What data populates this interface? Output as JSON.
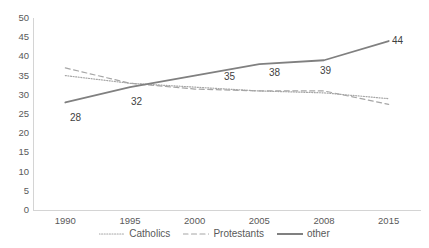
{
  "chart_data": {
    "type": "line",
    "title": "",
    "xlabel": "",
    "ylabel": "",
    "categories": [
      "1990",
      "1995",
      "2000",
      "2005",
      "2008",
      "2015"
    ],
    "ylim": [
      0,
      50
    ],
    "yticks": [
      "0",
      "5",
      "10",
      "15",
      "20",
      "25",
      "30",
      "35",
      "40",
      "45",
      "50"
    ],
    "grid": false,
    "legend_position": "bottom",
    "series": [
      {
        "name": "Catholics",
        "style": "dotted",
        "color": "#a6a6a6",
        "values": [
          35,
          33,
          32,
          31,
          30.5,
          29
        ],
        "labels": []
      },
      {
        "name": "Protestants",
        "style": "dashed",
        "color": "#a6a6a6",
        "values": [
          37,
          33,
          31.5,
          31,
          31,
          27.5
        ],
        "labels": []
      },
      {
        "name": "other",
        "style": "solid",
        "color": "#808080",
        "values": [
          28,
          32,
          35,
          38,
          39,
          44
        ],
        "labels": [
          "28",
          "32",
          "35",
          "38",
          "39",
          "44"
        ]
      }
    ],
    "data_labels": [
      {
        "text": "28",
        "x": 70,
        "y": 113
      },
      {
        "text": "32",
        "x": 131,
        "y": 97
      },
      {
        "text": "35",
        "x": 224,
        "y": 72
      },
      {
        "text": "38",
        "x": 269,
        "y": 68
      },
      {
        "text": "39",
        "x": 320,
        "y": 66
      },
      {
        "text": "44",
        "x": 392,
        "y": 36
      }
    ]
  },
  "legend": {
    "items": [
      {
        "label": "Catholics",
        "icon": "dotted-line-swatch"
      },
      {
        "label": "Protestants",
        "icon": "dashed-line-swatch"
      },
      {
        "label": "other",
        "icon": "solid-line-swatch"
      }
    ]
  }
}
